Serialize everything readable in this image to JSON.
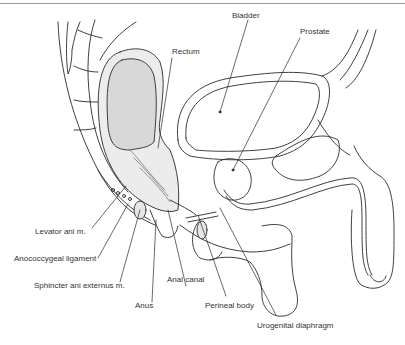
{
  "diagram": {
    "colors": {
      "line": "#2a2a2a",
      "rectum_fill": "#dcdcdc",
      "top_rule": "#9a9a9a"
    },
    "labels": [
      {
        "id": "bladder",
        "text": "Bladder"
      },
      {
        "id": "prostate",
        "text": "Prostate"
      },
      {
        "id": "rectum",
        "text": "Rectum"
      },
      {
        "id": "levator",
        "text": "Levator ani m."
      },
      {
        "id": "anococcygeal",
        "text": "Anococcygeal ligament"
      },
      {
        "id": "sphincter",
        "text": "Sphincter ani externus m."
      },
      {
        "id": "anal_canal",
        "text": "Anal canal"
      },
      {
        "id": "anus",
        "text": "Anus"
      },
      {
        "id": "perineal",
        "text": "Perineal body"
      },
      {
        "id": "urogenital",
        "text": "Urogenital diaphragm"
      }
    ]
  }
}
